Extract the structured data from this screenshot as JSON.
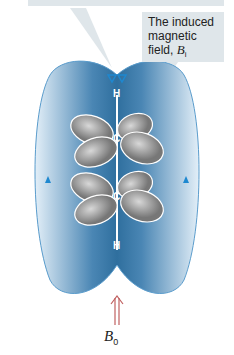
{
  "callout_top": {
    "text": ""
  },
  "callout_induced": {
    "line1": "The induced",
    "line2": "magnetic",
    "line3": "field, ",
    "symbol": "B",
    "subscript": "i"
  },
  "atoms": {
    "h_top": "H",
    "c_top": "C",
    "c_bottom": "C",
    "h_bottom": "H"
  },
  "applied_field": {
    "symbol": "B",
    "subscript": "0"
  },
  "colors": {
    "field_dark": "#2f6f9e",
    "field_light": "#cfe3f1",
    "arrow_blue": "#1e88d0",
    "arrow_red": "#c06060",
    "lobe": "#9a9a9a"
  }
}
